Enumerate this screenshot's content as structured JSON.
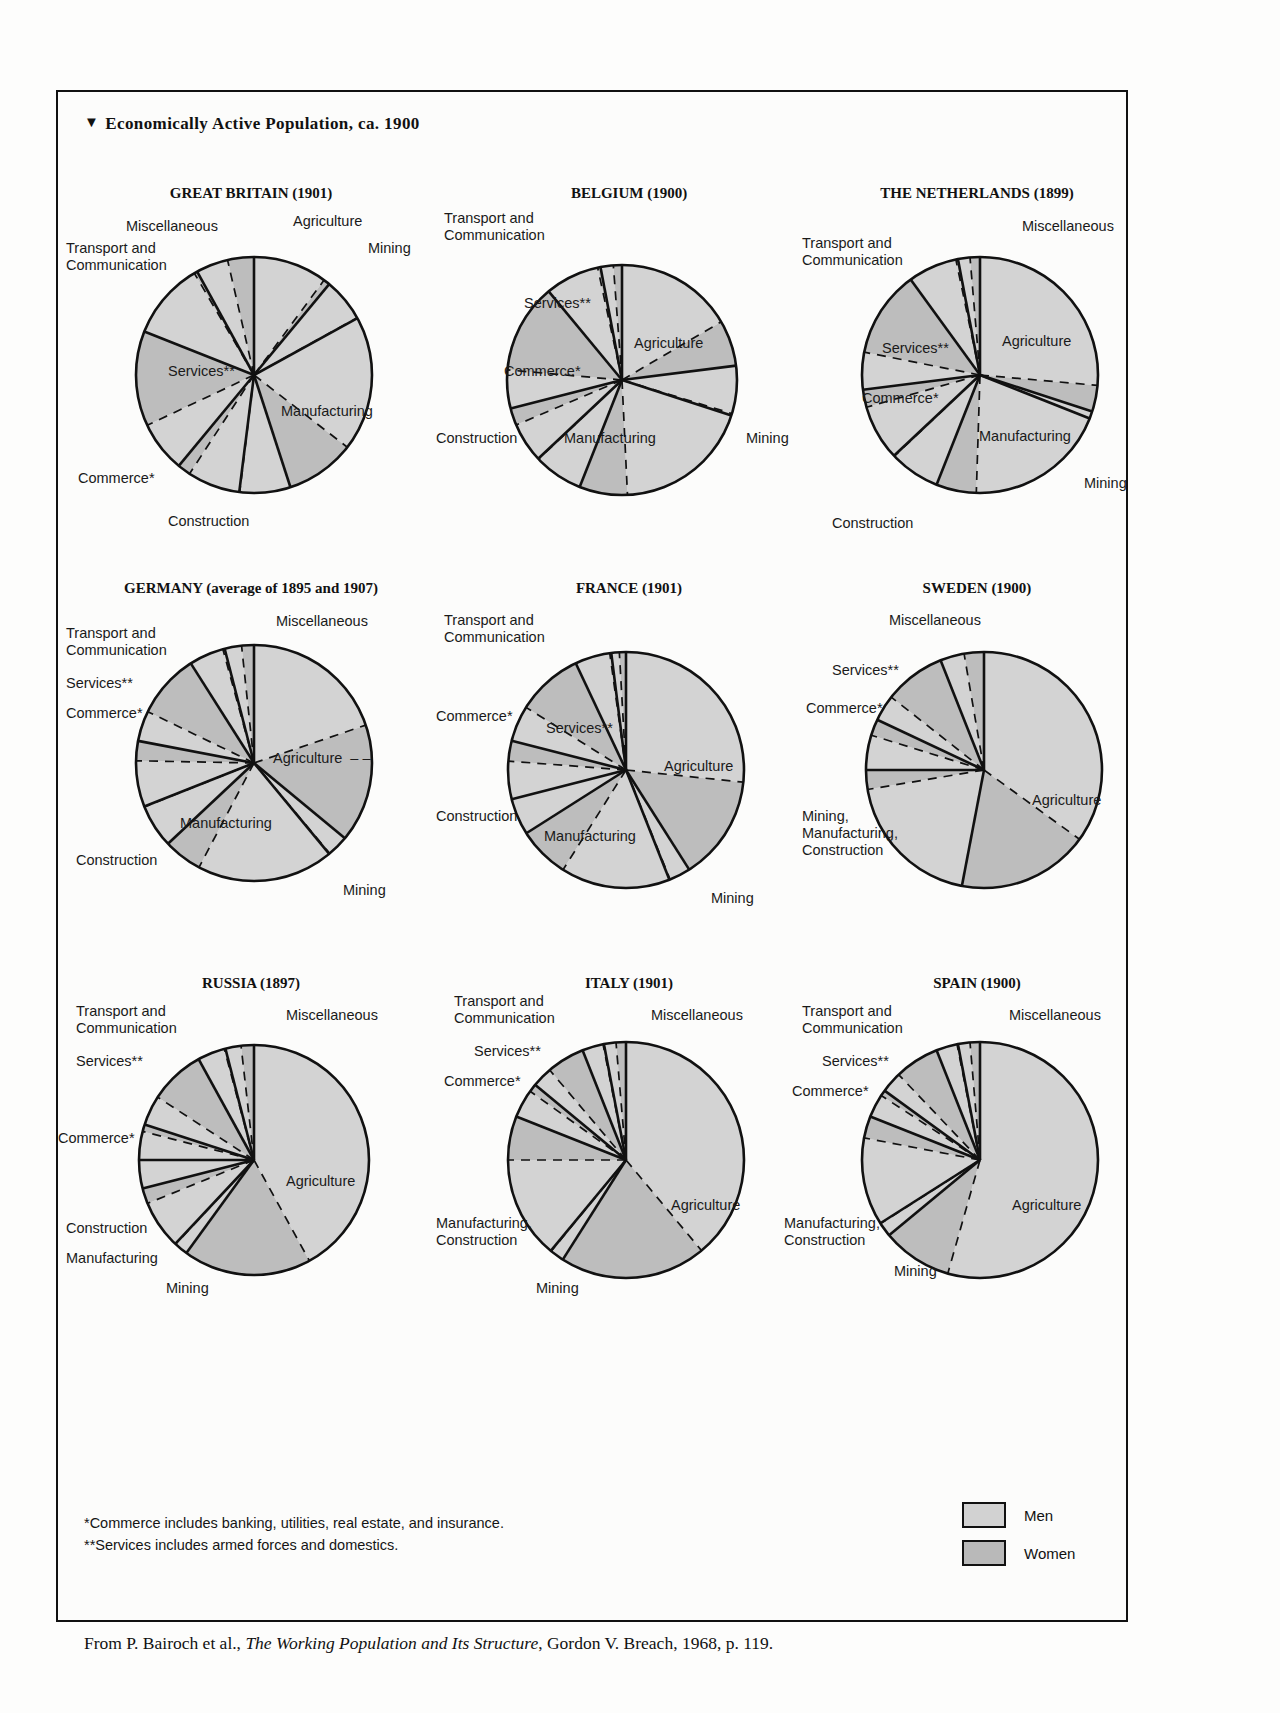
{
  "figure": {
    "title": "Economically Active Population, ca. 1900",
    "title_marker": "▼",
    "notes": [
      "*Commerce includes banking, utilities, real estate, and insurance.",
      "**Services includes armed forces and domestics."
    ],
    "source_prefix": "From P. Bairoch et al., ",
    "source_italic": "The Working Population and Its Structure",
    "source_suffix": ", Gordon V. Breach, 1968, p. 119."
  },
  "legend": {
    "title": "",
    "items": [
      {
        "label": "Men",
        "color": "#d2d2d2"
      },
      {
        "label": "Women",
        "color": "#b9b9b9"
      }
    ]
  },
  "chart_data": [
    {
      "type": "pie",
      "title": "GREAT BRITAIN (1901)",
      "categories": [
        "Agriculture",
        "Mining",
        "Manufacturing",
        "Construction",
        "Commerce*",
        "Services**",
        "Transport and Communication",
        "Miscellaneous"
      ],
      "values": [
        11,
        6,
        28,
        7,
        9,
        20,
        11,
        8
      ],
      "men_share": [
        0.92,
        0.99,
        0.66,
        0.99,
        0.8,
        0.35,
        0.96,
        0.55
      ],
      "ylabel": "",
      "xlabel": ""
    },
    {
      "type": "pie",
      "title": "BELGIUM (1900)",
      "categories": [
        "Agriculture",
        "Mining",
        "Manufacturing",
        "Construction",
        "Commerce*",
        "Services**",
        "Transport and Communication",
        "Miscellaneous"
      ],
      "values": [
        23,
        7,
        26,
        7,
        8,
        18,
        8,
        3
      ],
      "men_share": [
        0.72,
        0.96,
        0.74,
        0.99,
        0.7,
        0.3,
        0.95,
        0.6
      ],
      "ylabel": "",
      "xlabel": ""
    },
    {
      "type": "pie",
      "title": "THE NETHERLANDS (1899)",
      "categories": [
        "Agriculture",
        "Mining",
        "Manufacturing",
        "Construction",
        "Commerce*",
        "Services**",
        "Transport and Communication",
        "Miscellaneous"
      ],
      "values": [
        30,
        1,
        25,
        7,
        10,
        17,
        7,
        3
      ],
      "men_share": [
        0.88,
        0.99,
        0.78,
        0.99,
        0.76,
        0.3,
        0.96,
        0.55
      ],
      "ylabel": "",
      "xlabel": ""
    },
    {
      "type": "pie",
      "title": "GERMANY (average of 1895 and 1907)",
      "categories": [
        "Agriculture",
        "Mining",
        "Manufacturing",
        "Construction",
        "Commerce*",
        "Services**",
        "Transport and Communication",
        "Miscellaneous"
      ],
      "values": [
        36,
        3,
        24,
        6,
        9,
        13,
        5,
        4
      ],
      "men_share": [
        0.55,
        0.97,
        0.78,
        0.99,
        0.7,
        0.32,
        0.95,
        0.58
      ],
      "ylabel": "",
      "xlabel": ""
    },
    {
      "type": "pie",
      "title": "FRANCE (1901)",
      "categories": [
        "Agriculture",
        "Mining",
        "Manufacturing",
        "Construction",
        "Commerce*",
        "Services**",
        "Transport and Communication",
        "Miscellaneous"
      ],
      "values": [
        41,
        3,
        22,
        5,
        8,
        14,
        5,
        2
      ],
      "men_share": [
        0.65,
        0.97,
        0.68,
        0.99,
        0.65,
        0.35,
        0.96,
        0.55
      ],
      "ylabel": "",
      "xlabel": ""
    },
    {
      "type": "pie",
      "title": "SWEDEN (1900)",
      "categories": [
        "Agriculture",
        "Mining, Manufacturing, Construction",
        "Commerce*",
        "Services**",
        "Miscellaneous"
      ],
      "values": [
        53,
        22,
        7,
        12,
        6
      ],
      "men_share": [
        0.66,
        0.88,
        0.68,
        0.3,
        0.55
      ],
      "ylabel": "",
      "xlabel": ""
    },
    {
      "type": "pie",
      "title": "RUSSIA (1897)",
      "categories": [
        "Agriculture",
        "Mining",
        "Manufacturing",
        "Construction",
        "Commerce*",
        "Services**",
        "Transport and Communication",
        "Miscellaneous"
      ],
      "values": [
        60,
        2,
        9,
        4,
        5,
        12,
        4,
        4
      ],
      "men_share": [
        0.7,
        0.97,
        0.76,
        0.99,
        0.8,
        0.35,
        0.96,
        0.55
      ],
      "ylabel": "",
      "xlabel": ""
    },
    {
      "type": "pie",
      "title": "ITALY (1901)",
      "categories": [
        "Agriculture",
        "Mining",
        "Manufacturing, Construction",
        "Commerce*",
        "Services**",
        "Transport and Communication",
        "Miscellaneous"
      ],
      "values": [
        59,
        2,
        20,
        5,
        8,
        3,
        3
      ],
      "men_share": [
        0.66,
        0.97,
        0.7,
        0.78,
        0.35,
        0.96,
        0.55
      ],
      "ylabel": "",
      "xlabel": ""
    },
    {
      "type": "pie",
      "title": "SPAIN (1900)",
      "categories": [
        "Agriculture",
        "Mining",
        "Manufacturing, Construction",
        "Commerce*",
        "Services**",
        "Transport and Communication",
        "Miscellaneous"
      ],
      "values": [
        64,
        2,
        15,
        4,
        9,
        3,
        3
      ],
      "men_share": [
        0.85,
        0.97,
        0.8,
        0.8,
        0.32,
        0.96,
        0.55
      ],
      "ylabel": "",
      "xlabel": ""
    }
  ],
  "labels": {
    "great_britain": [
      {
        "text": "Miscellaneous",
        "x": 68,
        "y": 33
      },
      {
        "text": "Transport and\nCommunication",
        "x": 8,
        "y": 55
      },
      {
        "text": "Agriculture",
        "x": 235,
        "y": 28
      },
      {
        "text": "Mining",
        "x": 310,
        "y": 55
      },
      {
        "text": "Services**",
        "x": 110,
        "y": 178
      },
      {
        "text": "Manufacturing",
        "x": 223,
        "y": 218
      },
      {
        "text": "Commerce*",
        "x": 20,
        "y": 285
      },
      {
        "text": "Construction",
        "x": 110,
        "y": 328
      }
    ],
    "belgium": [
      {
        "text": "Transport and\nCommunication",
        "x": 8,
        "y": 25
      },
      {
        "text": "Services**",
        "x": 88,
        "y": 110
      },
      {
        "text": "Agriculture",
        "x": 198,
        "y": 150
      },
      {
        "text": "Commerce*",
        "x": 68,
        "y": 178
      },
      {
        "text": "Construction",
        "x": 0,
        "y": 245
      },
      {
        "text": "Manufacturing",
        "x": 128,
        "y": 245
      },
      {
        "text": "Mining",
        "x": 310,
        "y": 245
      }
    ],
    "netherlands": [
      {
        "text": "Miscellaneous",
        "x": 238,
        "y": 33
      },
      {
        "text": "Transport and\nCommunication",
        "x": 18,
        "y": 50
      },
      {
        "text": "Services**",
        "x": 98,
        "y": 155
      },
      {
        "text": "Agriculture",
        "x": 218,
        "y": 148
      },
      {
        "text": "Commerce*",
        "x": 78,
        "y": 205
      },
      {
        "text": "Manufacturing",
        "x": 195,
        "y": 243
      },
      {
        "text": "Mining",
        "x": 300,
        "y": 290
      },
      {
        "text": "Construction",
        "x": 48,
        "y": 330
      }
    ],
    "germany": [
      {
        "text": "Miscellaneous",
        "x": 218,
        "y": 33
      },
      {
        "text": "Transport and\nCommunication",
        "x": 8,
        "y": 45
      },
      {
        "text": "Services**",
        "x": 8,
        "y": 95
      },
      {
        "text": "Commerce*",
        "x": 8,
        "y": 125
      },
      {
        "text": "Agriculture  – –",
        "x": 215,
        "y": 170
      },
      {
        "text": "Manufacturing",
        "x": 122,
        "y": 235
      },
      {
        "text": "Construction",
        "x": 18,
        "y": 272
      },
      {
        "text": "Mining",
        "x": 285,
        "y": 302
      }
    ],
    "france": [
      {
        "text": "Transport and\nCommunication",
        "x": 8,
        "y": 32
      },
      {
        "text": "Commerce*",
        "x": 0,
        "y": 128
      },
      {
        "text": "Services**",
        "x": 110,
        "y": 140
      },
      {
        "text": "Agriculture",
        "x": 228,
        "y": 178
      },
      {
        "text": "Construction",
        "x": 0,
        "y": 228
      },
      {
        "text": "Manufacturing",
        "x": 108,
        "y": 248
      },
      {
        "text": "Mining",
        "x": 275,
        "y": 310
      }
    ],
    "sweden": [
      {
        "text": "Miscellaneous",
        "x": 105,
        "y": 32
      },
      {
        "text": "Services**",
        "x": 48,
        "y": 82
      },
      {
        "text": "Commerce*",
        "x": 22,
        "y": 120
      },
      {
        "text": "Agriculture",
        "x": 248,
        "y": 212
      },
      {
        "text": "Mining,\nManufacturing,\nConstruction",
        "x": 18,
        "y": 228
      }
    ],
    "russia": [
      {
        "text": "Miscellaneous",
        "x": 228,
        "y": 32
      },
      {
        "text": "Transport and\nCommunication",
        "x": 18,
        "y": 28
      },
      {
        "text": "Services**",
        "x": 18,
        "y": 78
      },
      {
        "text": "Commerce*",
        "x": 0,
        "y": 155
      },
      {
        "text": "Agriculture",
        "x": 228,
        "y": 198
      },
      {
        "text": "Construction",
        "x": 8,
        "y": 245
      },
      {
        "text": "Manufacturing",
        "x": 8,
        "y": 275
      },
      {
        "text": "Mining",
        "x": 108,
        "y": 305
      }
    ],
    "italy": [
      {
        "text": "Transport and\nCommunication",
        "x": 18,
        "y": 18
      },
      {
        "text": "Miscellaneous",
        "x": 215,
        "y": 32
      },
      {
        "text": "Services**",
        "x": 38,
        "y": 68
      },
      {
        "text": "Commerce*",
        "x": 8,
        "y": 98
      },
      {
        "text": "Agriculture",
        "x": 235,
        "y": 222
      },
      {
        "text": "Manufacturing,\nConstruction",
        "x": 0,
        "y": 240
      },
      {
        "text": "Mining",
        "x": 100,
        "y": 305
      }
    ],
    "spain": [
      {
        "text": "Transport and\nCommunication",
        "x": 18,
        "y": 28
      },
      {
        "text": "Miscellaneous",
        "x": 225,
        "y": 32
      },
      {
        "text": "Services**",
        "x": 38,
        "y": 78
      },
      {
        "text": "Commerce*",
        "x": 8,
        "y": 108
      },
      {
        "text": "Agriculture",
        "x": 228,
        "y": 222
      },
      {
        "text": "Manufacturing,\nConstruction",
        "x": 0,
        "y": 240
      },
      {
        "text": "Mining",
        "x": 110,
        "y": 288
      }
    ]
  }
}
